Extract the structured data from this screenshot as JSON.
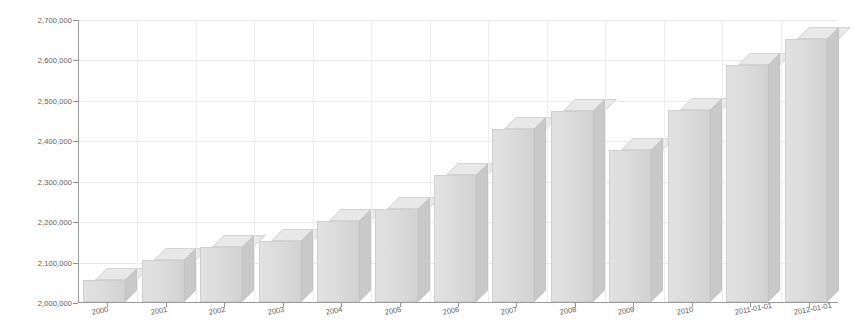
{
  "chart_data": {
    "type": "bar",
    "title": "",
    "subtitle": "",
    "xlabel": "",
    "ylabel": "",
    "grid": true,
    "legend": "none",
    "three_d": true,
    "bar_color": "#dcdcdc",
    "bar_side_color": "#c9c9c9",
    "bar_top_color": "#e8e8e8",
    "axis_color": "#9a9a9a",
    "grid_color": "#e9e9e9",
    "ylim": [
      2000000,
      2700000
    ],
    "y_ticks": [
      "2,000,000",
      "2,100,000",
      "2,200,000",
      "2,300,000",
      "2,400,000",
      "2,500,000",
      "2,600,000",
      "2,700,000"
    ],
    "y_tick_values": [
      2000000,
      2100000,
      2200000,
      2300000,
      2400000,
      2500000,
      2600000,
      2700000
    ],
    "categories": [
      "2000",
      "2001",
      "2002",
      "2003",
      "2004",
      "2005",
      "2006",
      "2007",
      "2008",
      "2009",
      "2010",
      "2011-01-01",
      "2012-01-01"
    ],
    "values": [
      2055000,
      2105000,
      2135000,
      2150000,
      2200000,
      2230000,
      2315000,
      2427000,
      2472000,
      2375000,
      2475000,
      2586000,
      2650000
    ]
  }
}
